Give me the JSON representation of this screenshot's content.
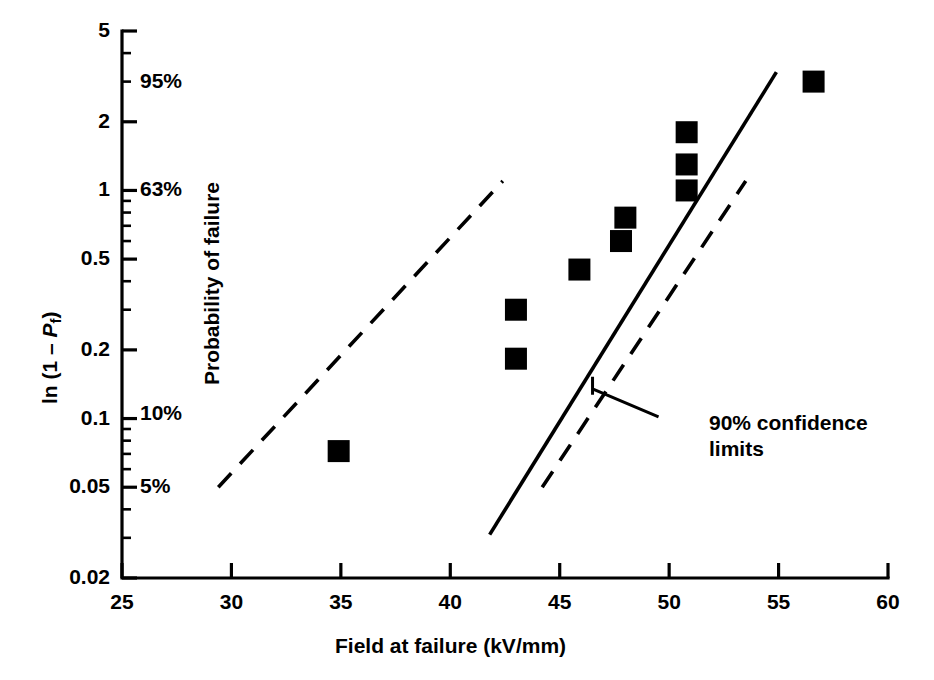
{
  "chart_data": {
    "type": "scatter",
    "title": "",
    "xlabel": "Field at failure (kV/mm)",
    "ylabel": "ln (1 – Pf)",
    "ylabel_secondary": "Probability of failure",
    "xlim": [
      25,
      60
    ],
    "ylim": [
      0.02,
      5
    ],
    "yscale": "log",
    "xscale": "linear",
    "grid": false,
    "legend": false,
    "x_ticks": [
      25,
      30,
      35,
      40,
      45,
      50,
      55,
      60
    ],
    "x_tick_labels": [
      "25",
      "30",
      "35",
      "40",
      "45",
      "50",
      "55",
      "60"
    ],
    "y_major_ticks": [
      0.02,
      0.05,
      0.1,
      0.2,
      0.5,
      1,
      2,
      5
    ],
    "y_tick_labels": [
      "0.02",
      "0.05",
      "0.1",
      "0.2",
      "0.5",
      "1",
      "2",
      "5"
    ],
    "probability_labels": [
      {
        "text": "95%",
        "y_value": 3.0
      },
      {
        "text": "63%",
        "y_value": 1.0
      },
      {
        "text": "10%",
        "y_value": 0.105
      },
      {
        "text": "5%",
        "y_value": 0.05
      }
    ],
    "series": [
      {
        "name": "Failure data",
        "type": "scatter",
        "marker": "square",
        "color": "#000000",
        "points": [
          {
            "x": 34.9,
            "y": 0.072
          },
          {
            "x": 43.0,
            "y": 0.183
          },
          {
            "x": 43.0,
            "y": 0.3
          },
          {
            "x": 45.9,
            "y": 0.45
          },
          {
            "x": 47.8,
            "y": 0.6
          },
          {
            "x": 48.0,
            "y": 0.76
          },
          {
            "x": 50.8,
            "y": 1.0
          },
          {
            "x": 50.8,
            "y": 1.3
          },
          {
            "x": 50.8,
            "y": 1.8
          },
          {
            "x": 56.6,
            "y": 3.0
          }
        ]
      },
      {
        "name": "Best fit line",
        "type": "line",
        "style": "solid",
        "color": "#000000",
        "points": [
          {
            "x": 41.8,
            "y": 0.031
          },
          {
            "x": 54.9,
            "y": 3.3
          }
        ]
      },
      {
        "name": "Upper 90% confidence limit",
        "type": "line",
        "style": "dashed",
        "color": "#000000",
        "points": [
          {
            "x": 29.4,
            "y": 0.05
          },
          {
            "x": 42.4,
            "y": 1.1
          }
        ]
      },
      {
        "name": "Lower 90% confidence limit",
        "type": "line",
        "style": "dashed",
        "color": "#000000",
        "points": [
          {
            "x": 44.2,
            "y": 0.05
          },
          {
            "x": 53.5,
            "y": 1.1
          }
        ]
      }
    ],
    "annotations": [
      {
        "name": "confidence-limits-annotation",
        "line1": "90% confidence",
        "line2": "limits",
        "text": "90% confidence limits",
        "points_to_x": 46.5,
        "points_to_y": 0.135
      }
    ]
  },
  "axes": {
    "y_axis_title_prefix": "ln (1 – ",
    "y_axis_title_var": "P",
    "y_axis_title_sub": "f",
    "y_axis_title_suffix": ")",
    "y_axis_secondary_title": "Probability of failure",
    "x_axis_title": "Field at failure (kV/mm)"
  },
  "colors": {
    "ink": "#000000",
    "background": "#ffffff"
  }
}
